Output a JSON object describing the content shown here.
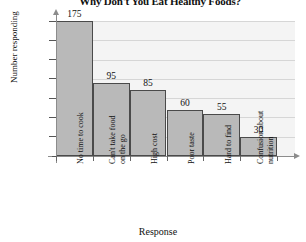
{
  "chart_data": {
    "type": "bar",
    "title": "Why Don't You Eat Healthy Foods?",
    "xlabel": "Response",
    "ylabel": "Number responding",
    "categories": [
      "No time to cook",
      "Can't take food on the go",
      "High cost",
      "Poor taste",
      "Hard to find",
      "Confusion about nutrition"
    ],
    "category_lines": [
      [
        "No time to cook"
      ],
      [
        "Can't take food",
        "on the go"
      ],
      [
        "High cost"
      ],
      [
        "Poor taste"
      ],
      [
        "Hard to find"
      ],
      [
        "Confusion about",
        "nutrition"
      ]
    ],
    "values": [
      175,
      95,
      85,
      60,
      55,
      30
    ],
    "bar_pixel_values": [
      175,
      95,
      85,
      60,
      55,
      25
    ],
    "value_labels": [
      "175",
      "95",
      "85",
      "60",
      "55",
      "30"
    ],
    "ylim": [
      0,
      175
    ],
    "yticks": [
      0,
      25,
      50,
      75,
      100,
      125,
      150,
      175
    ],
    "ytick_labels": [
      "",
      "25",
      "50",
      "75",
      "100",
      "125",
      "150",
      "175"
    ],
    "grid": true,
    "legend": "none",
    "bar_fill_color": "#b9b9b9",
    "bar_border_color": "#4a4a4a",
    "plot_background_color": "#f4f4f4",
    "gridline_color": "#d6d6d6",
    "axis_color": "#8c8c8c"
  }
}
